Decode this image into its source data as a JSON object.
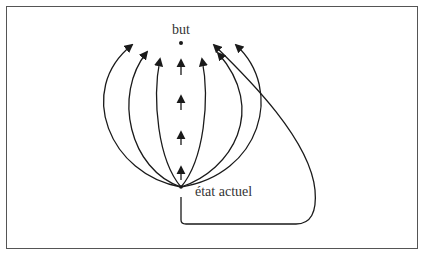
{
  "diagram": {
    "labels": {
      "goal": "but",
      "current_state": "état actuel"
    },
    "stroke_color": "#1a1a1a",
    "frame_color": "#555555"
  }
}
